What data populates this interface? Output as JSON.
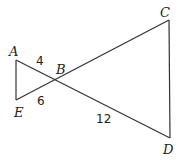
{
  "diagram": {
    "type": "geometry",
    "points": {
      "A": {
        "label": "A",
        "x": 16,
        "y": 60
      },
      "B": {
        "label": "B",
        "x": 56,
        "y": 81
      },
      "C": {
        "label": "C",
        "x": 169,
        "y": 20
      },
      "D": {
        "label": "D",
        "x": 170,
        "y": 138
      },
      "E": {
        "label": "E",
        "x": 16,
        "y": 100
      }
    },
    "segments": [
      "AD",
      "EC",
      "AE",
      "CD"
    ],
    "measurements": {
      "AB": "4",
      "EB": "6",
      "BD": "12"
    }
  }
}
